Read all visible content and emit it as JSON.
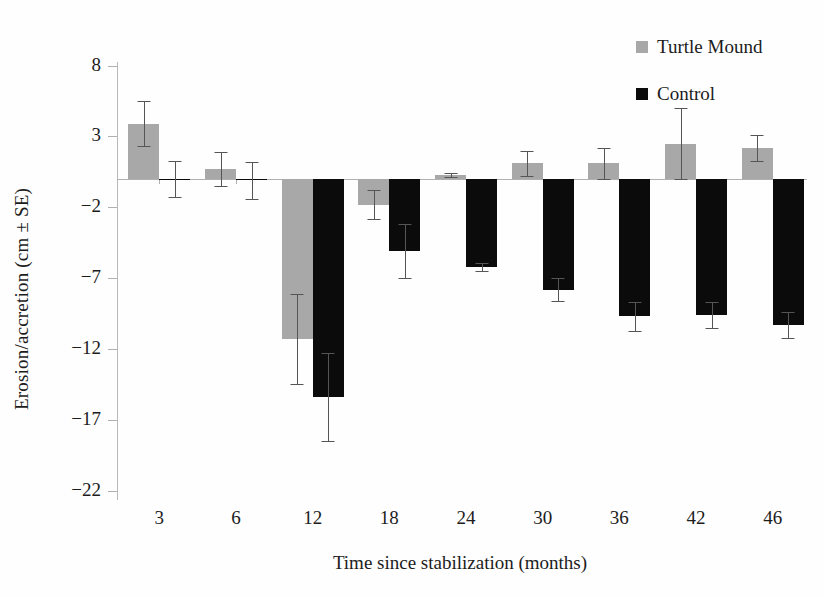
{
  "chart_data": {
    "type": "bar",
    "title": "",
    "xlabel": "Time since stabilization (months)",
    "ylabel": "Erosion/accretion (cm ± SE)",
    "categories": [
      "3",
      "6",
      "12",
      "18",
      "24",
      "30",
      "36",
      "42",
      "46"
    ],
    "ylim": [
      -22,
      10
    ],
    "yticks": [
      8,
      3,
      -2,
      -7,
      -12,
      -17,
      -22
    ],
    "ytick_labels": [
      "8",
      "3",
      "−2",
      "−7",
      "−12",
      "−17",
      "−22"
    ],
    "grid": false,
    "legend_position": "top-right",
    "zero_line": 0,
    "series": [
      {
        "name": "Turtle Mound",
        "color": "#a8a8a8",
        "values": [
          3.9,
          0.7,
          -11.3,
          -1.8,
          0.3,
          1.1,
          1.1,
          2.5,
          2.2
        ],
        "errors": [
          1.6,
          1.2,
          3.2,
          1.0,
          0.15,
          0.9,
          1.1,
          2.5,
          0.9
        ]
      },
      {
        "name": "Control",
        "color": "#0b0b0b",
        "values": [
          0.0,
          -0.1,
          -15.4,
          -5.1,
          -6.2,
          -7.8,
          -9.7,
          -9.6,
          -10.3
        ],
        "errors": [
          1.3,
          1.3,
          3.1,
          1.9,
          0.3,
          0.8,
          1.0,
          0.9,
          0.9
        ]
      }
    ]
  },
  "legend": {
    "items": [
      {
        "label": "Turtle Mound",
        "color": "#a8a8a8"
      },
      {
        "label": "Control",
        "color": "#0b0b0b"
      }
    ]
  },
  "axes": {
    "y_title": "Erosion/accretion (cm ± SE)",
    "x_title": "Time since stabilization (months)"
  },
  "colors": {
    "mound": "#a8a8a8",
    "control": "#0b0b0b",
    "axis": "#b0b0b0",
    "error": "#555555",
    "text": "#1c1c1c",
    "background": "#ffffff"
  }
}
